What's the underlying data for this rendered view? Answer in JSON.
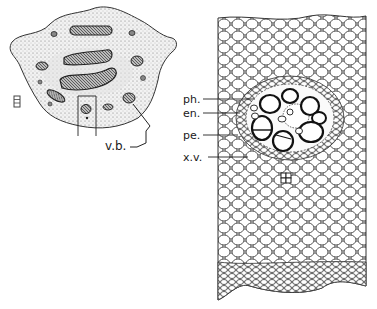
{
  "figure": {
    "left_panel": {
      "description": "Transverse section of stem (low power), stippled ground tissue with scattered vascular bundles",
      "scale_mark": "E",
      "labels": {
        "vascular_bundle": "v.b."
      }
    },
    "right_panel": {
      "description": "Detail of a single vascular bundle in parenchymatous ground tissue",
      "labels": {
        "phloem": "ph.",
        "endodermis": "en.",
        "pericycle": "pe.",
        "xylem_vessel": "x.v."
      }
    },
    "colors": {
      "ink": "#1a1a1a",
      "paper": "#ffffff",
      "stipple": "#dcdcdc"
    }
  }
}
